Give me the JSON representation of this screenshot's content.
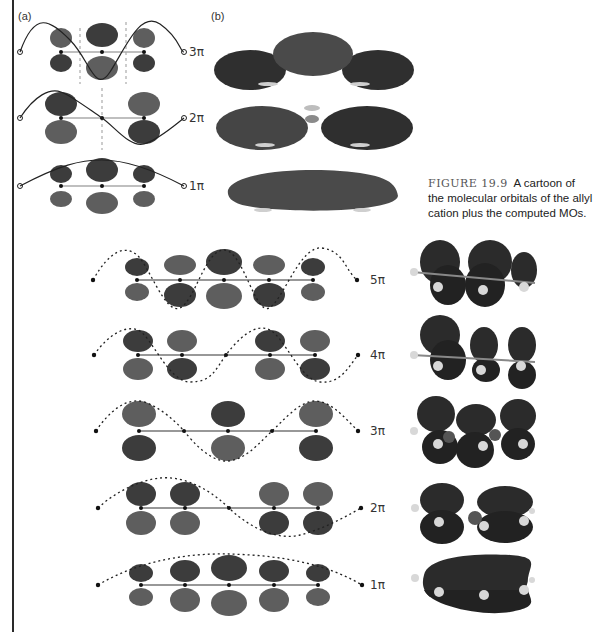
{
  "figure": {
    "number": "FIGURE 19.9",
    "caption": "A cartoon of the molecular orbitals of the allyl cation plus the computed MOs.",
    "panel_a_label": "(a)",
    "panel_b_label": "(b)"
  },
  "allyl": {
    "levels": [
      "3π",
      "2π",
      "1π"
    ]
  },
  "pentadienyl": {
    "levels": [
      "5π",
      "4π",
      "3π",
      "2π",
      "1π"
    ]
  },
  "colors": {
    "lobe_dark": "#3c3c3c",
    "lobe_light": "#5e5e5e",
    "computed_mo": "#2b2b2b",
    "hydrogen": "#d8d8d8",
    "bond": "#555555"
  }
}
